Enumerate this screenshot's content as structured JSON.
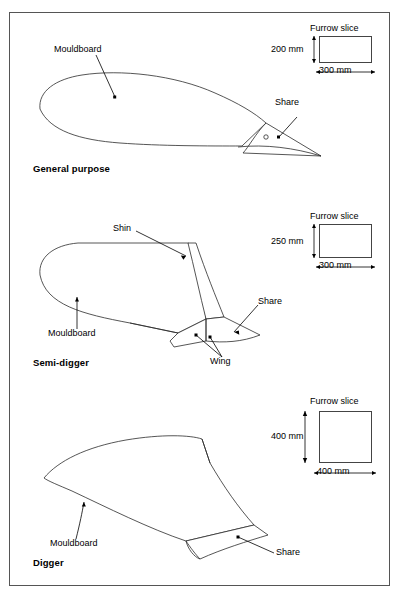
{
  "figure": {
    "panels": [
      {
        "id": "general",
        "title": "General purpose",
        "callouts": [
          {
            "name": "mouldboard",
            "text": "Mouldboard"
          },
          {
            "name": "share",
            "text": "Share"
          }
        ],
        "furrow_slice": {
          "title": "Furrow slice",
          "depth_label": "200 mm",
          "width_label": "300 mm"
        }
      },
      {
        "id": "semi-digger",
        "title": "Semi-digger",
        "callouts": [
          {
            "name": "shin",
            "text": "Shin"
          },
          {
            "name": "mouldboard",
            "text": "Mouldboard"
          },
          {
            "name": "share",
            "text": "Share"
          },
          {
            "name": "wing",
            "text": "Wing"
          }
        ],
        "furrow_slice": {
          "title": "Furrow slice",
          "depth_label": "250 mm",
          "width_label": "300 mm"
        }
      },
      {
        "id": "digger",
        "title": "Digger",
        "callouts": [
          {
            "name": "mouldboard",
            "text": "Mouldboard"
          },
          {
            "name": "share",
            "text": "Share"
          }
        ],
        "furrow_slice": {
          "title": "Furrow slice",
          "depth_label": "400 mm",
          "width_label": "400 mm"
        }
      }
    ],
    "colors": {
      "frame": "#555555",
      "outline": "#2b2b2b",
      "background": "#ffffff",
      "text": "#000000"
    }
  }
}
